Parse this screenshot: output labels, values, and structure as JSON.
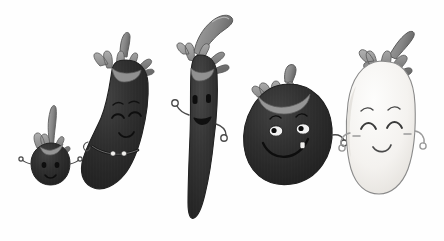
{
  "scene": {
    "title": "Five cartoon eggplant characters in a row",
    "background_color": "#fefefe",
    "width": 444,
    "height": 241,
    "medium": "pencil and watercolor illustration, grayscale"
  },
  "palette": {
    "background": "#fefefe",
    "body_dark": "#2c2c2c",
    "body_dark_shade": "#1a1a1a",
    "body_dark_highlight": "#4a4a4a",
    "body_white": "#f6f5f3",
    "body_white_shade": "#e4e2de",
    "calyx_gray": "#8d8d8d",
    "calyx_gray_dark": "#6a6a6a",
    "calyx_gray_light": "#b0b0b0",
    "outline": "#3a3a3a",
    "outline_light": "#8a8a8a",
    "eye_white": "#f4f4f4",
    "mouth_dark": "#141414",
    "button_white": "#f0efed"
  },
  "characters": [
    {
      "id": "eggplant-1",
      "name": "tiny-eggplant",
      "label": "Tiny eggplant",
      "size_rank": 1,
      "body_color": "#2c2c2c",
      "body_shape": "small teardrop",
      "stem": "long thin curved stem",
      "expression": "shy smile",
      "eyes": "two small dots",
      "mouth": "small curved smile",
      "has_eyebrows": false,
      "has_arms": true,
      "arms": "two tiny curled arms",
      "has_belt": false,
      "has_blush": false,
      "has_tooth": false,
      "x": 24,
      "y": 107,
      "width": 52,
      "height": 78
    },
    {
      "id": "eggplant-2",
      "name": "curved-eggplant",
      "label": "Long curved eggplant",
      "size_rank": 2,
      "body_color": "#2c2c2c",
      "body_shape": "long banana-like curve",
      "stem": "short upright stem with wide leaf crown",
      "expression": "content closed-eye smile",
      "eyes": "closed happy arcs",
      "mouth": "small curved smile",
      "has_eyebrows": true,
      "has_arms": false,
      "arms": "",
      "has_belt": true,
      "belt": "strap with two round buttons",
      "has_blush": false,
      "has_tooth": false,
      "x": 82,
      "y": 32,
      "width": 82,
      "height": 168
    },
    {
      "id": "eggplant-3",
      "name": "tall-slim-eggplant",
      "label": "Tall slim eggplant",
      "size_rank": 3,
      "body_color": "#323232",
      "body_shape": "very tall narrow column",
      "stem": "long sweeping curved stem with leaf crown",
      "expression": "cheerful open grin",
      "eyes": "two large oval eyes",
      "mouth": "open smiling mouth",
      "has_eyebrows": false,
      "has_arms": true,
      "arms": "two curled arms raised at sides",
      "has_belt": false,
      "has_blush": false,
      "has_tooth": false,
      "x": 170,
      "y": 14,
      "width": 80,
      "height": 208
    },
    {
      "id": "eggplant-4",
      "name": "round-eggplant",
      "label": "Round plump eggplant",
      "size_rank": 4,
      "body_color": "#2a2a2a",
      "body_shape": "round plump oval",
      "stem": "short thick stem with star-shaped crown",
      "expression": "big toothy grin",
      "eyes": "two white eyes with dark pupils",
      "mouth": "wide curving smile",
      "has_eyebrows": true,
      "has_arms": true,
      "arms": "one curled arm on the right",
      "has_belt": false,
      "has_blush": false,
      "has_tooth": true,
      "tooth": "single white tooth",
      "x": 243,
      "y": 63,
      "width": 93,
      "height": 125
    },
    {
      "id": "eggplant-5",
      "name": "white-eggplant",
      "label": "White eggplant",
      "size_rank": 5,
      "body_color": "#f6f5f3",
      "body_shape": "rounded oval, pale",
      "stem": "tilted stem with drooping leaf crown",
      "expression": "blushing closed-eye smile",
      "eyes": "closed happy arcs",
      "mouth": "small curved smile",
      "has_eyebrows": true,
      "has_arms": true,
      "arms": "two curled arms at sides",
      "has_belt": false,
      "has_blush": true,
      "blush": "two cheek blush strokes",
      "has_tooth": false,
      "x": 337,
      "y": 26,
      "width": 96,
      "height": 170
    }
  ]
}
